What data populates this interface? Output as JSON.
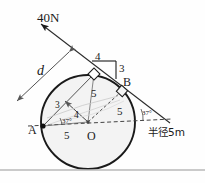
{
  "figure": {
    "colors": {
      "stroke": "#1a1a1a",
      "thin": "#555555",
      "disk_fill": "#f3f3f3",
      "dashed": "#444444",
      "separator": "#b9b9b9",
      "background": "#fefefe"
    },
    "labels": {
      "force": "40N",
      "moment_arm": "d",
      "point_a": "A",
      "point_b": "B",
      "center_o": "O",
      "radius_note": "半径5m",
      "tri_top_horizontal": "4",
      "tri_top_vertical": "3",
      "tri_left_side": "3",
      "tri_inner_4": "4",
      "tri_upper_5": "5",
      "tri_right_5": "5",
      "tri_bottom_5": "5",
      "angle_left": "37",
      "angle_right": "37",
      "degree_symbol": "°"
    },
    "geometry": {
      "circle_center_x": 88,
      "circle_center_y": 122,
      "circle_radius": 47,
      "point_a_x": 43,
      "point_a_y": 126,
      "point_b_x": 122,
      "point_b_y": 91,
      "tangent_point_x": 94,
      "tangent_point_y": 74,
      "force_tip_x": 38,
      "force_tip_y": 21,
      "radius_value_m": 5,
      "force_value_n": 40,
      "angle_deg": 37
    },
    "annotations": {
      "right_angle_markers": 2,
      "dimension_arrows": 1,
      "separator_y": 170
    }
  }
}
